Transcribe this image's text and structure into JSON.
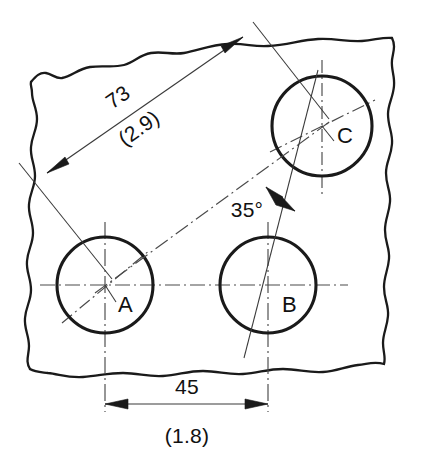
{
  "drawing": {
    "title": "Hole position dimensioning detail",
    "background_color": "#ffffff",
    "line_color": "#1a1a1a",
    "thin_line_color": "#3a3a3a",
    "center_line_color": "#4a4a4a",
    "holes": [
      {
        "id": "A",
        "label": "A",
        "cx": 105,
        "cy": 285,
        "r": 48
      },
      {
        "id": "B",
        "label": "B",
        "cx": 268,
        "cy": 285,
        "r": 48
      },
      {
        "id": "C",
        "label": "C",
        "cx": 322,
        "cy": 126,
        "r": 50
      }
    ],
    "hole_label_positions": [
      {
        "label": "A",
        "x": 118,
        "y": 312
      },
      {
        "label": "B",
        "x": 282,
        "y": 312
      },
      {
        "label": "C",
        "x": 337,
        "y": 143
      }
    ],
    "dimensions": [
      {
        "id": "linear-diagonal",
        "primary_value": "73",
        "secondary_value": "(2.9)",
        "from_hole": "A",
        "to_hole": "C",
        "text_rotation_deg": -35,
        "primary_pos": {
          "x": 122,
          "y": 103
        },
        "secondary_pos": {
          "x": 137,
          "y": 133
        }
      },
      {
        "id": "angular",
        "primary_value": "35°",
        "vertex_hole": "C",
        "text_pos": {
          "x": 247,
          "y": 217
        }
      },
      {
        "id": "linear-horizontal",
        "primary_value": "45",
        "secondary_value": "(1.8)",
        "from_hole": "A",
        "to_hole": "B",
        "primary_pos": {
          "x": 187,
          "y": 394
        },
        "secondary_pos": {
          "x": 187,
          "y": 443
        }
      }
    ]
  }
}
